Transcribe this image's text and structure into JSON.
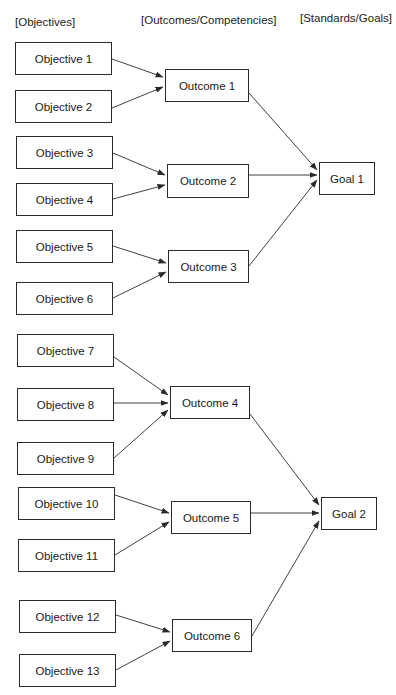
{
  "headers": {
    "objectives": "[Objectives]",
    "outcomes": "[Outcomes/Competencies]",
    "goals": "[Standards/Goals]"
  },
  "colors": {
    "line": "#2a2a2a",
    "box_border": "#2a2a2a",
    "text": "#1a1a1a",
    "background": "#ffffff"
  },
  "objectives": [
    {
      "id": "o1",
      "label": "Objective 1",
      "x": 15,
      "y": 42,
      "w": 97,
      "h": 33,
      "to": "c1"
    },
    {
      "id": "o2",
      "label": "Objective 2",
      "x": 15,
      "y": 90,
      "w": 97,
      "h": 33,
      "to": "c1"
    },
    {
      "id": "o3",
      "label": "Objective 3",
      "x": 16,
      "y": 136,
      "w": 97,
      "h": 33,
      "to": "c2"
    },
    {
      "id": "o4",
      "label": "Objective 4",
      "x": 16,
      "y": 183,
      "w": 97,
      "h": 33,
      "to": "c2"
    },
    {
      "id": "o5",
      "label": "Objective 5",
      "x": 16,
      "y": 230,
      "w": 97,
      "h": 33,
      "to": "c3"
    },
    {
      "id": "o6",
      "label": "Objective 6",
      "x": 16,
      "y": 282,
      "w": 97,
      "h": 33,
      "to": "c3"
    },
    {
      "id": "o7",
      "label": "Objective 7",
      "x": 17,
      "y": 334,
      "w": 97,
      "h": 33,
      "to": "c4"
    },
    {
      "id": "o8",
      "label": "Objective 8",
      "x": 17,
      "y": 388,
      "w": 97,
      "h": 33,
      "to": "c4"
    },
    {
      "id": "o9",
      "label": "Objective 9",
      "x": 17,
      "y": 442,
      "w": 97,
      "h": 33,
      "to": "c4"
    },
    {
      "id": "o10",
      "label": "Objective 10",
      "x": 18,
      "y": 487,
      "w": 97,
      "h": 33,
      "to": "c5"
    },
    {
      "id": "o11",
      "label": "Objective 11",
      "x": 18,
      "y": 539,
      "w": 97,
      "h": 33,
      "to": "c5"
    },
    {
      "id": "o12",
      "label": "Objective 12",
      "x": 19,
      "y": 600,
      "w": 97,
      "h": 33,
      "to": "c6"
    },
    {
      "id": "o13",
      "label": "Objective 13",
      "x": 19,
      "y": 654,
      "w": 97,
      "h": 33,
      "to": "c6"
    }
  ],
  "outcomes": [
    {
      "id": "c1",
      "label": "Outcome 1",
      "x": 165,
      "y": 69,
      "w": 84,
      "h": 33,
      "to": "g1"
    },
    {
      "id": "c2",
      "label": "Outcome 2",
      "x": 167,
      "y": 164,
      "w": 82,
      "h": 34,
      "to": "g1"
    },
    {
      "id": "c3",
      "label": "Outcome 3",
      "x": 168,
      "y": 250,
      "w": 81,
      "h": 33,
      "to": "g1"
    },
    {
      "id": "c4",
      "label": "Outcome 4",
      "x": 170,
      "y": 386,
      "w": 80,
      "h": 33,
      "to": "g2"
    },
    {
      "id": "c5",
      "label": "Outcome 5",
      "x": 171,
      "y": 501,
      "w": 80,
      "h": 33,
      "to": "g2"
    },
    {
      "id": "c6",
      "label": "Outcome 6",
      "x": 172,
      "y": 619,
      "w": 80,
      "h": 33,
      "to": "g2"
    }
  ],
  "goals": [
    {
      "id": "g1",
      "label": "Goal 1",
      "x": 319,
      "y": 162,
      "w": 56,
      "h": 33
    },
    {
      "id": "g2",
      "label": "Goal 2",
      "x": 321,
      "y": 497,
      "w": 56,
      "h": 33
    }
  ],
  "edges": [
    {
      "from": "o1",
      "to": "c1",
      "x1": 112,
      "y1": 59,
      "x2": 163,
      "y2": 77
    },
    {
      "from": "o2",
      "to": "c1",
      "x1": 112,
      "y1": 108,
      "x2": 163,
      "y2": 87
    },
    {
      "from": "o3",
      "to": "c2",
      "x1": 113,
      "y1": 153,
      "x2": 165,
      "y2": 175
    },
    {
      "from": "o4",
      "to": "c2",
      "x1": 113,
      "y1": 199,
      "x2": 165,
      "y2": 185
    },
    {
      "from": "o5",
      "to": "c3",
      "x1": 113,
      "y1": 246,
      "x2": 166,
      "y2": 263
    },
    {
      "from": "o6",
      "to": "c3",
      "x1": 113,
      "y1": 298,
      "x2": 166,
      "y2": 272
    },
    {
      "from": "o7",
      "to": "c4",
      "x1": 114,
      "y1": 357,
      "x2": 168,
      "y2": 395
    },
    {
      "from": "o8",
      "to": "c4",
      "x1": 114,
      "y1": 403,
      "x2": 168,
      "y2": 403
    },
    {
      "from": "o9",
      "to": "c4",
      "x1": 114,
      "y1": 458,
      "x2": 168,
      "y2": 410
    },
    {
      "from": "o10",
      "to": "c5",
      "x1": 115,
      "y1": 495,
      "x2": 169,
      "y2": 513
    },
    {
      "from": "o11",
      "to": "c5",
      "x1": 115,
      "y1": 555,
      "x2": 169,
      "y2": 522
    },
    {
      "from": "o12",
      "to": "c6",
      "x1": 116,
      "y1": 615,
      "x2": 170,
      "y2": 632
    },
    {
      "from": "o13",
      "to": "c6",
      "x1": 116,
      "y1": 670,
      "x2": 170,
      "y2": 641
    },
    {
      "from": "c1",
      "to": "g1",
      "x1": 249,
      "y1": 93,
      "x2": 317,
      "y2": 170
    },
    {
      "from": "c2",
      "to": "g1",
      "x1": 249,
      "y1": 175,
      "x2": 317,
      "y2": 175
    },
    {
      "from": "c3",
      "to": "g1",
      "x1": 249,
      "y1": 266,
      "x2": 317,
      "y2": 180
    },
    {
      "from": "c4",
      "to": "g2",
      "x1": 250,
      "y1": 414,
      "x2": 319,
      "y2": 505
    },
    {
      "from": "c5",
      "to": "g2",
      "x1": 251,
      "y1": 513,
      "x2": 319,
      "y2": 513
    },
    {
      "from": "c6",
      "to": "g2",
      "x1": 252,
      "y1": 636,
      "x2": 319,
      "y2": 521
    }
  ]
}
